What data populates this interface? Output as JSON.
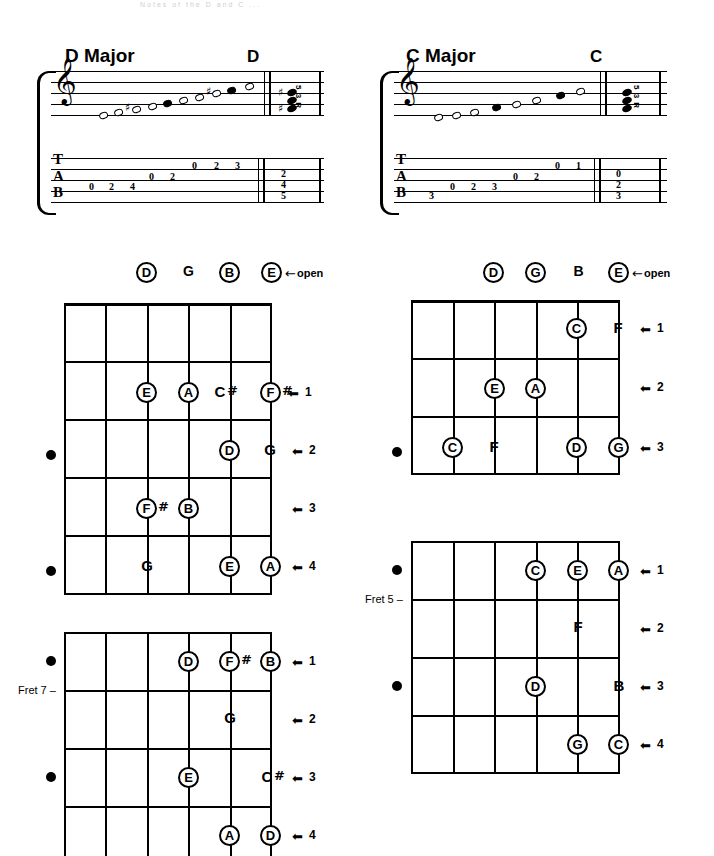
{
  "page": {
    "top_caption": "Notes of the D and C ... ",
    "background": "#ffffff",
    "ink": "#000000"
  },
  "scales": [
    {
      "id": "d-major",
      "title": "D Major",
      "chord_name": "D",
      "clef": "treble",
      "chord_degrees": "5 3 R",
      "staff_notes": [
        {
          "name": "D",
          "accidental": "",
          "filled": false
        },
        {
          "name": "E",
          "accidental": "",
          "filled": false
        },
        {
          "name": "F#",
          "accidental": "#",
          "filled": false
        },
        {
          "name": "G",
          "accidental": "",
          "filled": false
        },
        {
          "name": "A",
          "accidental": "",
          "filled": true
        },
        {
          "name": "B",
          "accidental": "",
          "filled": false
        },
        {
          "name": "C#",
          "accidental": "#",
          "filled": false
        },
        {
          "name": "D",
          "accidental": "",
          "filled": true
        },
        {
          "name": "E",
          "accidental": "",
          "filled": false
        }
      ],
      "tab_letters": "TAB",
      "tab_notes": [
        {
          "string": "A",
          "fret": "0"
        },
        {
          "string": "A",
          "fret": "2"
        },
        {
          "string": "A",
          "fret": "4"
        },
        {
          "string": "D",
          "fret": "0"
        },
        {
          "string": "D",
          "fret": "2"
        },
        {
          "string": "G",
          "fret": "0"
        },
        {
          "string": "G",
          "fret": "2"
        },
        {
          "string": "G",
          "fret": "3"
        }
      ],
      "tab_chord": [
        "2",
        "4",
        "5"
      ]
    },
    {
      "id": "c-major",
      "title": "C Major",
      "chord_name": "C",
      "clef": "treble",
      "chord_degrees": "5 3 R",
      "staff_notes": [
        {
          "name": "C",
          "accidental": "",
          "filled": false
        },
        {
          "name": "D",
          "accidental": "",
          "filled": false
        },
        {
          "name": "E",
          "accidental": "",
          "filled": false
        },
        {
          "name": "F",
          "accidental": "",
          "filled": true
        },
        {
          "name": "G",
          "accidental": "",
          "filled": false
        },
        {
          "name": "A",
          "accidental": "",
          "filled": false
        },
        {
          "name": "B",
          "accidental": "",
          "filled": true
        },
        {
          "name": "C",
          "accidental": "",
          "filled": false
        }
      ],
      "tab_letters": "TAB",
      "tab_notes": [
        {
          "string": "B",
          "fret": "3"
        },
        {
          "string": "A",
          "fret": "0"
        },
        {
          "string": "A",
          "fret": "2"
        },
        {
          "string": "A",
          "fret": "3"
        },
        {
          "string": "D",
          "fret": "0"
        },
        {
          "string": "D",
          "fret": "2"
        },
        {
          "string": "G",
          "fret": "0"
        },
        {
          "string": "G",
          "fret": "1"
        }
      ],
      "tab_chord": [
        "0",
        "2",
        "3"
      ]
    }
  ],
  "open_rows": [
    {
      "id": "open-row-d",
      "arrow": "←",
      "label": "open",
      "items": [
        {
          "note": "D",
          "circled": true
        },
        {
          "note": "G",
          "circled": false
        },
        {
          "note": "B",
          "circled": true
        },
        {
          "note": "E",
          "circled": true
        }
      ]
    },
    {
      "id": "open-row-c",
      "arrow": "←",
      "label": "open",
      "items": [
        {
          "note": "D",
          "circled": true
        },
        {
          "note": "G",
          "circled": true
        },
        {
          "note": "B",
          "circled": false
        },
        {
          "note": "E",
          "circled": true
        }
      ]
    }
  ],
  "fretboards": [
    {
      "id": "fb-d-open",
      "strings": 6,
      "frets": 5,
      "fret_numbers": [
        "1",
        "2",
        "3",
        "4"
      ],
      "fret_label": "",
      "position_dots": [
        2,
        4
      ],
      "notes": [
        {
          "fret": 2,
          "string": 3,
          "note": "E",
          "accidental": "",
          "circled": true
        },
        {
          "fret": 2,
          "string": 4,
          "note": "A",
          "accidental": "",
          "circled": true
        },
        {
          "fret": 2,
          "string": 5,
          "note": "C",
          "accidental": "#",
          "circled": false
        },
        {
          "fret": 2,
          "string": 6,
          "note": "F",
          "accidental": "#",
          "circled": true
        },
        {
          "fret": 3,
          "string": 5,
          "note": "D",
          "accidental": "",
          "circled": true
        },
        {
          "fret": 3,
          "string": 6,
          "note": "G",
          "accidental": "",
          "circled": false
        },
        {
          "fret": 4,
          "string": 3,
          "note": "F",
          "accidental": "#",
          "circled": true
        },
        {
          "fret": 4,
          "string": 4,
          "note": "B",
          "accidental": "",
          "circled": true
        },
        {
          "fret": 5,
          "string": 3,
          "note": "G",
          "accidental": "",
          "circled": false
        },
        {
          "fret": 5,
          "string": 5,
          "note": "E",
          "accidental": "",
          "circled": true
        },
        {
          "fret": 5,
          "string": 6,
          "note": "A",
          "accidental": "",
          "circled": true
        }
      ]
    },
    {
      "id": "fb-c-open",
      "strings": 6,
      "frets": 3,
      "fret_numbers": [
        "1",
        "2",
        "3"
      ],
      "fret_label": "",
      "position_dots": [
        3
      ],
      "notes": [
        {
          "fret": 1,
          "string": 5,
          "note": "C",
          "accidental": "",
          "circled": true
        },
        {
          "fret": 1,
          "string": 6,
          "note": "F",
          "accidental": "",
          "circled": false
        },
        {
          "fret": 2,
          "string": 3,
          "note": "E",
          "accidental": "",
          "circled": true
        },
        {
          "fret": 2,
          "string": 4,
          "note": "A",
          "accidental": "",
          "circled": true
        },
        {
          "fret": 3,
          "string": 2,
          "note": "C",
          "accidental": "",
          "circled": true
        },
        {
          "fret": 3,
          "string": 3,
          "note": "F",
          "accidental": "",
          "circled": false
        },
        {
          "fret": 3,
          "string": 5,
          "note": "D",
          "accidental": "",
          "circled": true
        },
        {
          "fret": 3,
          "string": 6,
          "note": "G",
          "accidental": "",
          "circled": true
        }
      ]
    },
    {
      "id": "fb-c-fret5",
      "strings": 6,
      "frets": 4,
      "fret_numbers": [
        "1",
        "2",
        "3",
        "4"
      ],
      "fret_label": "Fret 5 –",
      "position_dots": [
        1,
        3
      ],
      "notes": [
        {
          "fret": 1,
          "string": 4,
          "note": "C",
          "accidental": "",
          "circled": true
        },
        {
          "fret": 1,
          "string": 5,
          "note": "E",
          "accidental": "",
          "circled": true
        },
        {
          "fret": 1,
          "string": 6,
          "note": "A",
          "accidental": "",
          "circled": true
        },
        {
          "fret": 2,
          "string": 5,
          "note": "F",
          "accidental": "",
          "circled": false
        },
        {
          "fret": 3,
          "string": 4,
          "note": "D",
          "accidental": "",
          "circled": true
        },
        {
          "fret": 3,
          "string": 6,
          "note": "B",
          "accidental": "",
          "circled": false
        },
        {
          "fret": 4,
          "string": 5,
          "note": "G",
          "accidental": "",
          "circled": true
        },
        {
          "fret": 4,
          "string": 6,
          "note": "C",
          "accidental": "",
          "circled": true
        }
      ]
    },
    {
      "id": "fb-d-fret7",
      "strings": 6,
      "frets": 4,
      "fret_numbers": [
        "1",
        "2",
        "3",
        "4"
      ],
      "fret_label": "Fret 7 –",
      "position_dots": [
        1,
        3
      ],
      "notes": [
        {
          "fret": 1,
          "string": 4,
          "note": "D",
          "accidental": "",
          "circled": true
        },
        {
          "fret": 1,
          "string": 5,
          "note": "F",
          "accidental": "#",
          "circled": true
        },
        {
          "fret": 1,
          "string": 6,
          "note": "B",
          "accidental": "",
          "circled": true
        },
        {
          "fret": 2,
          "string": 5,
          "note": "G",
          "accidental": "",
          "circled": false
        },
        {
          "fret": 3,
          "string": 4,
          "note": "E",
          "accidental": "",
          "circled": true
        },
        {
          "fret": 3,
          "string": 6,
          "note": "C",
          "accidental": "#",
          "circled": false
        },
        {
          "fret": 4,
          "string": 5,
          "note": "A",
          "accidental": "",
          "circled": true
        },
        {
          "fret": 4,
          "string": 6,
          "note": "D",
          "accidental": "",
          "circled": true
        }
      ]
    }
  ]
}
